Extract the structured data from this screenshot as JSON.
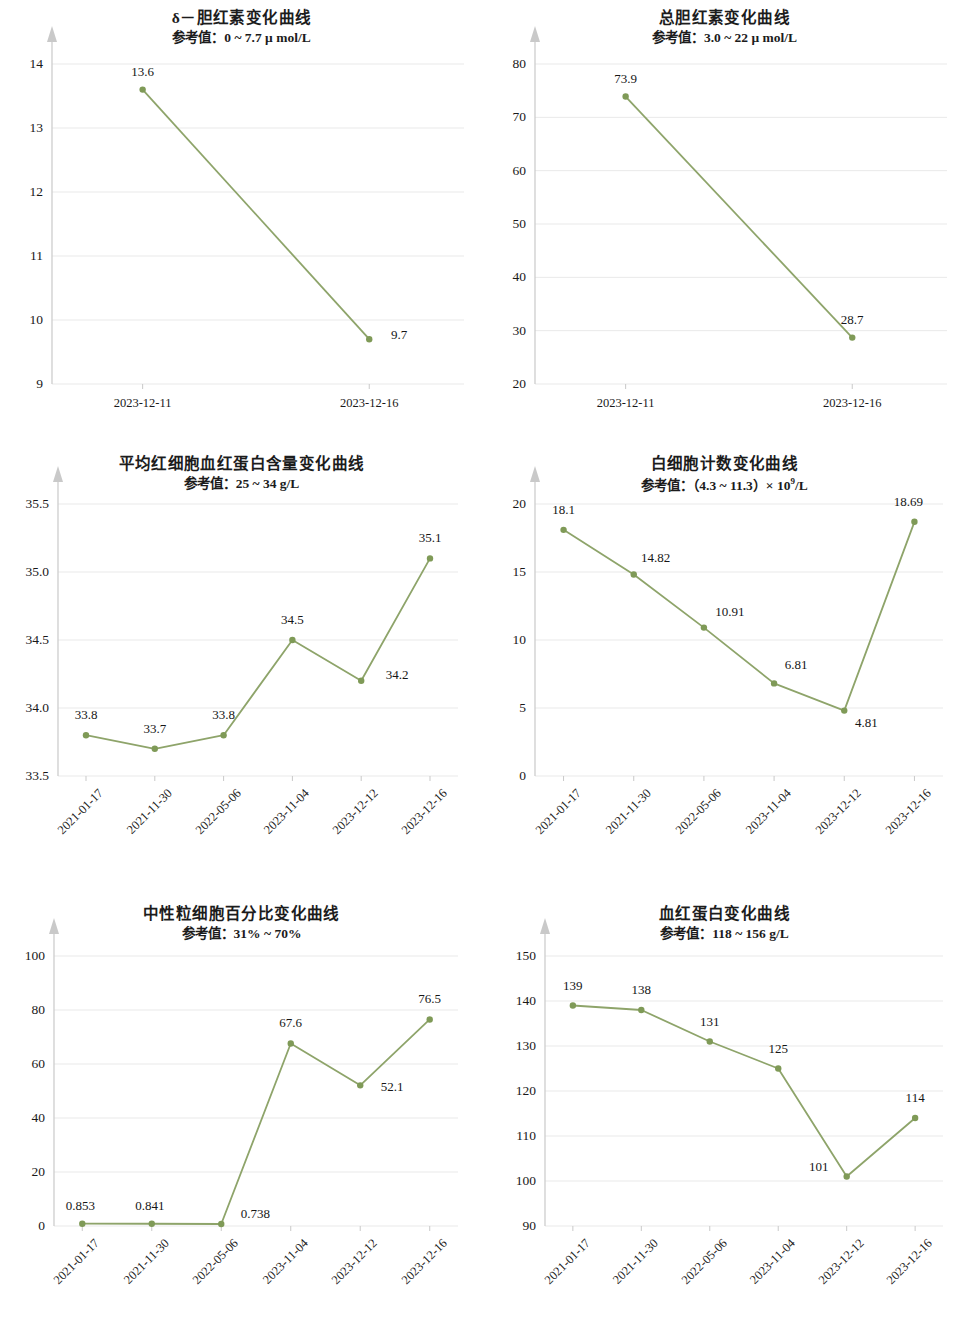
{
  "colors": {
    "line": "#8ea46a",
    "marker": "#7f9a57",
    "grid": "#e9e9e9",
    "axis": "#c9c9c9",
    "text": "#191919"
  },
  "charts": [
    {
      "id": "delta-bilirubin",
      "title": "δ－胆红素变化曲线",
      "subtitle": "参考值：0 ~ 7.7 μ mol/L",
      "subtitle_sup": "",
      "chart_data": {
        "type": "line",
        "title": "δ－胆红素变化曲线",
        "subtitle": "参考值：0 ~ 7.7 μ mol/L",
        "xlabel": "",
        "ylabel": "",
        "categories": [
          "2023-12-11",
          "2023-12-16"
        ],
        "values": [
          13.6,
          9.7
        ],
        "labels": [
          "13.6",
          "9.7"
        ],
        "yticks": [
          9,
          10,
          11,
          12,
          13,
          14
        ],
        "ytick_labels": [
          "9",
          "10",
          "11",
          "12",
          "13",
          "14"
        ],
        "ylim": [
          9,
          14
        ],
        "grid": true,
        "legend": "none",
        "rotated_xticks": false
      }
    },
    {
      "id": "total-bilirubin",
      "title": "总胆红素变化曲线",
      "subtitle": "参考值：3.0 ~ 22 μ mol/L",
      "subtitle_sup": "",
      "chart_data": {
        "type": "line",
        "title": "总胆红素变化曲线",
        "subtitle": "参考值：3.0 ~ 22 μ mol/L",
        "xlabel": "",
        "ylabel": "",
        "categories": [
          "2023-12-11",
          "2023-12-16"
        ],
        "values": [
          73.9,
          28.7
        ],
        "labels": [
          "73.9",
          "28.7"
        ],
        "yticks": [
          20,
          30,
          40,
          50,
          60,
          70,
          80
        ],
        "ytick_labels": [
          "20",
          "30",
          "40",
          "50",
          "60",
          "70",
          "80"
        ],
        "ylim": [
          20,
          80
        ],
        "grid": true,
        "legend": "none",
        "rotated_xticks": false
      }
    },
    {
      "id": "mch",
      "title": "平均红细胞血红蛋白含量变化曲线",
      "subtitle": "参考值：25 ~ 34 g/L",
      "subtitle_sup": "",
      "chart_data": {
        "type": "line",
        "title": "平均红细胞血红蛋白含量变化曲线",
        "subtitle": "参考值：25 ~ 34 g/L",
        "xlabel": "",
        "ylabel": "",
        "categories": [
          "2021-01-17",
          "2021-11-30",
          "2022-05-06",
          "2023-11-04",
          "2023-12-12",
          "2023-12-16"
        ],
        "values": [
          33.8,
          33.7,
          33.8,
          34.5,
          34.2,
          35.1
        ],
        "labels": [
          "33.8",
          "33.7",
          "33.8",
          "34.5",
          "34.2",
          "35.1"
        ],
        "yticks": [
          33.5,
          34.0,
          34.5,
          35.0,
          35.5
        ],
        "ytick_labels": [
          "33.5",
          "34.0",
          "34.5",
          "35.0",
          "35.5"
        ],
        "ylim": [
          33.5,
          35.5
        ],
        "grid": true,
        "legend": "none",
        "rotated_xticks": true
      }
    },
    {
      "id": "wbc",
      "title": "白细胞计数变化曲线",
      "subtitle": "参考值：（4.3 ~ 11.3）× 10",
      "subtitle_sup": "9",
      "subtitle_tail": "/L",
      "chart_data": {
        "type": "line",
        "title": "白细胞计数变化曲线",
        "subtitle": "参考值：（4.3 ~ 11.3）× 10⁹/L",
        "xlabel": "",
        "ylabel": "",
        "categories": [
          "2021-01-17",
          "2021-11-30",
          "2022-05-06",
          "2023-11-04",
          "2023-12-12",
          "2023-12-16"
        ],
        "values": [
          18.1,
          14.82,
          10.91,
          6.81,
          4.81,
          18.69
        ],
        "labels": [
          "18.1",
          "14.82",
          "10.91",
          "6.81",
          "4.81",
          "18.69"
        ],
        "yticks": [
          0,
          5,
          10,
          15,
          20
        ],
        "ytick_labels": [
          "0",
          "5",
          "10",
          "15",
          "20"
        ],
        "ylim": [
          0,
          20
        ],
        "grid": true,
        "legend": "none",
        "rotated_xticks": true
      }
    },
    {
      "id": "neutrophil-percent",
      "title": "中性粒细胞百分比变化曲线",
      "subtitle": "参考值：31% ~ 70%",
      "subtitle_sup": "",
      "chart_data": {
        "type": "line",
        "title": "中性粒细胞百分比变化曲线",
        "subtitle": "参考值：31% ~ 70%",
        "xlabel": "",
        "ylabel": "",
        "categories": [
          "2021-01-17",
          "2021-11-30",
          "2022-05-06",
          "2023-11-04",
          "2023-12-12",
          "2023-12-16"
        ],
        "values": [
          0.853,
          0.841,
          0.738,
          67.6,
          52.1,
          76.5
        ],
        "labels": [
          "0.853",
          "0.841",
          "0.738",
          "67.6",
          "52.1",
          "76.5"
        ],
        "yticks": [
          0,
          20,
          40,
          60,
          80,
          100
        ],
        "ytick_labels": [
          "0",
          "20",
          "40",
          "60",
          "80",
          "100"
        ],
        "ylim": [
          0,
          100
        ],
        "grid": true,
        "legend": "none",
        "rotated_xticks": true
      }
    },
    {
      "id": "hemoglobin",
      "title": "血红蛋白变化曲线",
      "subtitle": "参考值：118 ~ 156 g/L",
      "subtitle_sup": "",
      "chart_data": {
        "type": "line",
        "title": "血红蛋白变化曲线",
        "subtitle": "参考值：118 ~ 156 g/L",
        "xlabel": "",
        "ylabel": "",
        "categories": [
          "2021-01-17",
          "2021-11-30",
          "2022-05-06",
          "2023-11-04",
          "2023-12-12",
          "2023-12-16"
        ],
        "values": [
          139,
          138,
          131,
          125,
          101,
          114
        ],
        "labels": [
          "139",
          "138",
          "131",
          "125",
          "101",
          "114"
        ],
        "yticks": [
          90,
          100,
          110,
          120,
          130,
          140,
          150
        ],
        "ytick_labels": [
          "90",
          "100",
          "110",
          "120",
          "130",
          "140",
          "150"
        ],
        "ylim": [
          90,
          150
        ],
        "grid": true,
        "legend": "none",
        "rotated_xticks": true
      }
    }
  ]
}
